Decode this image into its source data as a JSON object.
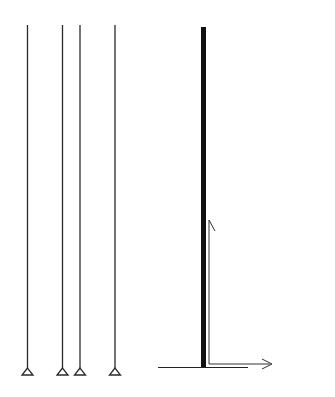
{
  "figure": {
    "left": {
      "description": "multi-story plane frame",
      "stories": 21,
      "bays": 3,
      "supports": 4
    },
    "right": {
      "description": "equivalent cantilever column",
      "axis_label": "x",
      "displacement_label": "δ(x)"
    }
  },
  "colors": {
    "ink": "#1a1a1a",
    "background": "#ffffff"
  }
}
